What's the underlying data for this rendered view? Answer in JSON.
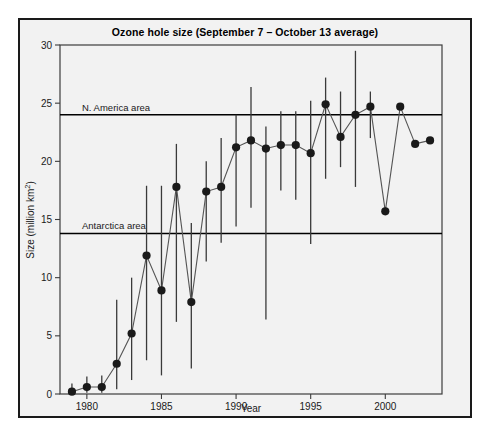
{
  "figure": {
    "title": "Ozone hole size (September 7 – October 13 average)",
    "background_color": "#f2f2f2",
    "border_color": "#1a1a1a",
    "plot_background": "#f2f2f2"
  },
  "chart_data": {
    "type": "scatter",
    "title": "Ozone hole size (September 7 – October 13 average)",
    "xlabel": "Year",
    "ylabel": "Size (million km²)",
    "xlim": [
      1978.2,
      2003.8
    ],
    "ylim": [
      0,
      30
    ],
    "xticks": [
      1980,
      1985,
      1990,
      1995,
      2000
    ],
    "xtick_labels": [
      "1980",
      "1985",
      "1990",
      "1995",
      "2000"
    ],
    "yticks": [
      0,
      5,
      10,
      15,
      20,
      25,
      30
    ],
    "ytick_labels": [
      "0",
      "5",
      "10",
      "15",
      "20",
      "25",
      "30"
    ],
    "grid": false,
    "legend": "none",
    "marker_color": "#1a1a1a",
    "line_color": "#555555",
    "errorbar_color": "#3a3a3a",
    "x": [
      1979,
      1980,
      1981,
      1982,
      1983,
      1984,
      1985,
      1986,
      1987,
      1988,
      1989,
      1990,
      1991,
      1992,
      1993,
      1994,
      1995,
      1996,
      1997,
      1998,
      1999,
      2000,
      2001,
      2002,
      2003
    ],
    "values": [
      0.2,
      0.6,
      0.6,
      2.6,
      5.2,
      11.9,
      8.9,
      17.8,
      7.9,
      17.4,
      17.8,
      21.2,
      21.8,
      21.1,
      21.4,
      21.4,
      20.7,
      24.9,
      22.1,
      24.0,
      24.7,
      15.7,
      24.7,
      21.5,
      21.8
    ],
    "err_low": [
      0.0,
      0.1,
      0.1,
      0.4,
      1.2,
      2.9,
      1.6,
      6.2,
      2.2,
      11.4,
      13.0,
      14.4,
      16.0,
      6.4,
      17.5,
      16.7,
      12.9,
      18.5,
      19.5,
      17.8,
      22.0,
      0.0,
      0.0,
      0.0,
      0.0
    ],
    "err_high": [
      0.9,
      1.5,
      1.6,
      8.1,
      10.0,
      17.9,
      17.9,
      21.5,
      14.7,
      20.0,
      22.0,
      24.0,
      26.4,
      23.0,
      24.3,
      24.3,
      25.2,
      27.2,
      26.0,
      29.5,
      26.0,
      0.0,
      0.0,
      0.0,
      0.0
    ],
    "series_order": [
      "ozone-hole-size"
    ],
    "reference_lines": [
      {
        "label": "N. America area",
        "value": 24.0,
        "color": "#000000"
      },
      {
        "label": "Antarctica area",
        "value": 13.8,
        "color": "#000000"
      }
    ],
    "annotations": []
  }
}
